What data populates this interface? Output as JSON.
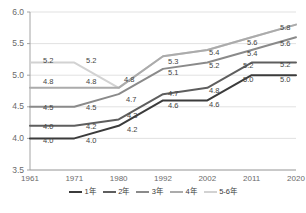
{
  "chart_data": {
    "type": "line",
    "title": "",
    "xlabel": "",
    "ylabel": "",
    "x": [
      "1961",
      "1971",
      "1980",
      "1992",
      "2002",
      "2011",
      "2020"
    ],
    "categories": [
      "1961",
      "1971",
      "1980",
      "1992",
      "2002",
      "2011",
      "2020"
    ],
    "ylim": [
      3.5,
      6.0
    ],
    "yticks": [
      "3.5",
      "4.0",
      "4.5",
      "5.0",
      "5.5",
      "6.0"
    ],
    "ytick_values": [
      3.5,
      4.0,
      4.5,
      5.0,
      5.5,
      6.0
    ],
    "grid": true,
    "legend_position": "bottom",
    "series": [
      {
        "name": "1年",
        "color": "#3b3b3b",
        "values": [
          4.0,
          4.0,
          4.2,
          4.6,
          4.6,
          5.0,
          5.0
        ],
        "labels": [
          "4.0",
          "4.0",
          "4.2",
          "4.6",
          "4.6",
          "5.0",
          "5.0"
        ]
      },
      {
        "name": "2年",
        "color": "#5e5e5e",
        "values": [
          4.2,
          4.2,
          4.3,
          4.7,
          4.8,
          5.2,
          5.2
        ],
        "labels": [
          "4.0",
          "4.2",
          "4.3",
          "4.7",
          "4.8",
          "5.2",
          "5.2"
        ]
      },
      {
        "name": "3年",
        "color": "#8a8a8a",
        "values": [
          4.5,
          4.5,
          4.7,
          5.1,
          5.2,
          5.4,
          5.6
        ],
        "labels": [
          "4.5",
          "4.5",
          "4.7",
          "5.1",
          "5.2",
          "5.4",
          "5.6"
        ]
      },
      {
        "name": "4年",
        "color": "#ababab",
        "values": [
          4.8,
          4.8,
          4.8,
          5.3,
          5.4,
          5.6,
          5.8
        ],
        "labels": [
          "4.8",
          "4.8",
          "4.8",
          "5.3",
          "5.4",
          "5.6",
          "5.8"
        ]
      },
      {
        "name": "5-6年",
        "color": "#d2d2d2",
        "values": [
          5.2,
          5.2,
          4.8,
          5.3,
          5.4,
          5.6,
          5.8
        ],
        "labels": [
          "5.2",
          "5.2",
          "",
          "",
          "",
          "",
          ""
        ]
      }
    ]
  },
  "axis": {
    "y_ticks": [
      "6.0",
      "5.5",
      "5.0",
      "4.5",
      "4.0",
      "3.5"
    ],
    "x_ticks": [
      "1961",
      "1971",
      "1980",
      "1992",
      "2002",
      "2011",
      "2020"
    ]
  },
  "legend": {
    "items": [
      {
        "label": "1年",
        "color": "#3b3b3b"
      },
      {
        "label": "2年",
        "color": "#5e5e5e"
      },
      {
        "label": "3年",
        "color": "#8a8a8a"
      },
      {
        "label": "4年",
        "color": "#ababab"
      },
      {
        "label": "5-6年",
        "color": "#d2d2d2"
      }
    ]
  },
  "data_labels": [
    {
      "text": "5.2",
      "x": 43,
      "y": 57
    },
    {
      "text": "5.2",
      "x": 86,
      "y": 57
    },
    {
      "text": "4.8",
      "x": 43,
      "y": 78
    },
    {
      "text": "4.8",
      "x": 86,
      "y": 78
    },
    {
      "text": "4.8",
      "x": 124,
      "y": 76
    },
    {
      "text": "4.5",
      "x": 43,
      "y": 104
    },
    {
      "text": "4.5",
      "x": 86,
      "y": 104
    },
    {
      "text": "4.7",
      "x": 126,
      "y": 96
    },
    {
      "text": "4.0",
      "x": 43,
      "y": 123
    },
    {
      "text": "4.2",
      "x": 86,
      "y": 123
    },
    {
      "text": "4.0",
      "x": 43,
      "y": 137
    },
    {
      "text": "4.0",
      "x": 86,
      "y": 137
    },
    {
      "text": "4.3",
      "x": 127,
      "y": 112
    },
    {
      "text": "4.2",
      "x": 127,
      "y": 126
    },
    {
      "text": "5.3",
      "x": 168,
      "y": 58
    },
    {
      "text": "5.1",
      "x": 168,
      "y": 69
    },
    {
      "text": "4.7",
      "x": 168,
      "y": 90
    },
    {
      "text": "4.6",
      "x": 168,
      "y": 102
    },
    {
      "text": "5.4",
      "x": 209,
      "y": 49
    },
    {
      "text": "5.2",
      "x": 209,
      "y": 62
    },
    {
      "text": "4.8",
      "x": 209,
      "y": 87
    },
    {
      "text": "4.6",
      "x": 209,
      "y": 101
    },
    {
      "text": "5.6",
      "x": 247,
      "y": 39
    },
    {
      "text": "5.4",
      "x": 247,
      "y": 50
    },
    {
      "text": "5.2",
      "x": 243,
      "y": 62
    },
    {
      "text": "5.0",
      "x": 243,
      "y": 76
    },
    {
      "text": "5.8",
      "x": 280,
      "y": 24
    },
    {
      "text": "5.6",
      "x": 280,
      "y": 40
    },
    {
      "text": "5.2",
      "x": 280,
      "y": 61
    },
    {
      "text": "5.0",
      "x": 280,
      "y": 76
    }
  ],
  "source_note": ""
}
